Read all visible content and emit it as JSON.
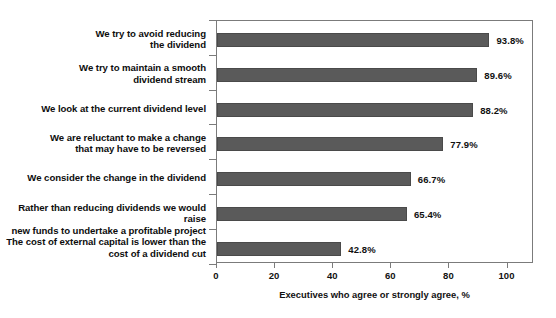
{
  "chart_data": {
    "type": "bar",
    "orientation": "horizontal",
    "title": "",
    "xlabel": "Executives who agree or strongly agree, %",
    "ylabel": "",
    "xlim": [
      0,
      109
    ],
    "xticks": [
      0,
      20,
      40,
      60,
      80,
      100
    ],
    "grid": false,
    "legend": null,
    "bar_color": "#5a5a5a",
    "categories": [
      "We try to avoid reducing\nthe dividend",
      "We try to maintain a smooth\ndividend stream",
      "We look at the current dividend level",
      "We are reluctant to make a change\nthat may have to be reversed",
      "We consider the change in the dividend",
      "Rather than reducing dividends we would raise\nnew funds to undertake a profitable project",
      "The cost of external capital is lower than the\ncost of a dividend cut"
    ],
    "values": [
      93.8,
      89.6,
      88.2,
      77.9,
      66.7,
      65.4,
      42.8
    ],
    "value_labels": [
      "93.8%",
      "89.6%",
      "88.2%",
      "77.9%",
      "66.7%",
      "65.4%",
      "42.8%"
    ],
    "xtick_labels": [
      "0",
      "20",
      "40",
      "60",
      "80",
      "100"
    ]
  }
}
